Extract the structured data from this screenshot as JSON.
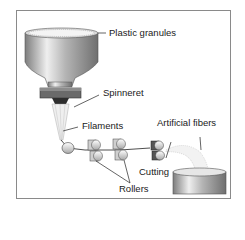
{
  "diagram": {
    "type": "process-flow",
    "labels": {
      "plastic_granules": "Plastic granules",
      "spinneret": "Spinneret",
      "filaments": "Filaments",
      "artificial_fibers": "Artificial fibers",
      "cutting": "Cutting",
      "rollers": "Rollers"
    },
    "stages": [
      "Plastic granules",
      "Spinneret",
      "Filaments",
      "Rollers",
      "Cutting",
      "Artificial fibers"
    ],
    "colors": {
      "frame": "#8a8a8a",
      "metal_light": "#e8e8e8",
      "metal_dark": "#7a7a7a",
      "spinneret": "#5a5a5a",
      "text": "#1a1a1a"
    }
  }
}
